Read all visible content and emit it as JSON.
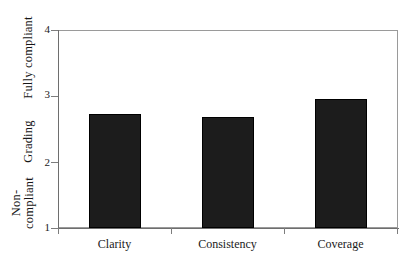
{
  "chart_data": {
    "type": "bar",
    "title": "",
    "subtitle": "",
    "xlabel": "",
    "ylabel": "Grading",
    "categories": [
      "Clarity",
      "Consistency",
      "Coverage"
    ],
    "values": [
      2.73,
      2.68,
      2.95
    ],
    "series": [
      {
        "name": "Grading",
        "values": [
          2.73,
          2.68,
          2.95
        ]
      }
    ],
    "ylim": [
      1,
      4
    ],
    "yticks": [
      1,
      2,
      3,
      4
    ],
    "ytick_labels": [
      "1",
      "2",
      "3",
      "4"
    ],
    "y_axis_band_labels": [
      {
        "text": "Fully compliant",
        "at": 4
      },
      {
        "text": "Grading",
        "at": 2.5
      },
      {
        "text": "Non-\ncompliant",
        "at": 1
      }
    ],
    "grid": false,
    "legend": false,
    "legend_position": "none",
    "bar_color": "#1c1c1c",
    "frame_color": "#9a9a9a",
    "axis_color": "#6e6e6e",
    "background_color": "#ffffff"
  },
  "axis": {
    "y_labels": {
      "t4": "4",
      "t3": "3",
      "t2": "2",
      "t1": "1"
    },
    "y_titles": {
      "fully_compliant": "Fully compliant",
      "grading": "Grading",
      "non_line1": "Non-",
      "non_line2": "compliant"
    },
    "x_labels": {
      "cat0": "Clarity",
      "cat1": "Consistency",
      "cat2": "Coverage"
    }
  }
}
